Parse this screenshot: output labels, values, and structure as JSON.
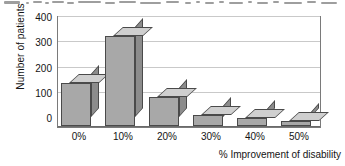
{
  "scan_artifact": {
    "description": "cut-off-text-sliver"
  },
  "chart_data": {
    "type": "bar",
    "title": "",
    "subtitle": "",
    "xlabel": "% Improvement of disability",
    "ylabel": "Number of patients",
    "categories": [
      "0%",
      "10%",
      "20%",
      "30%",
      "40%",
      "50%"
    ],
    "values": [
      170,
      355,
      115,
      45,
      30,
      20
    ],
    "ylim": [
      0,
      400
    ],
    "yticks": [
      0,
      100,
      200,
      300,
      400
    ],
    "ytick_labels": [
      "0",
      "100",
      "200",
      "300",
      "400"
    ],
    "grid": true,
    "legend": false,
    "legend_position": "none",
    "style_3d": true,
    "annotations": [],
    "colors": {
      "bar_front": "#a8a8a8",
      "bar_top": "#cfcfcf",
      "bar_side": "#8c8c8c",
      "bar_edge": "#4a4a4a",
      "gridline": "#c9c9c9",
      "axis": "#7a7a7a",
      "plot_background": "#ffffff",
      "text": "#141414"
    }
  }
}
